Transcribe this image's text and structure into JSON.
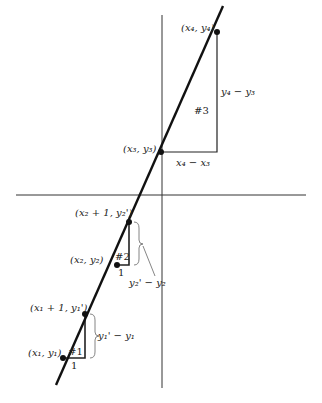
{
  "diagram": {
    "colors": {
      "line": "#111111",
      "axis": "#333333",
      "background": "#ffffff"
    },
    "axes": {
      "horizontal": {
        "x1": 16,
        "y1": 195,
        "x2": 306,
        "y2": 195
      },
      "vertical": {
        "x1": 162,
        "y1": 15,
        "x2": 162,
        "y2": 388
      }
    },
    "main_line": {
      "x1": 56,
      "y1": 385,
      "x2": 223,
      "y2": 6
    },
    "points": [
      {
        "id": "p4",
        "label": "(x4, y4)",
        "x": 217,
        "y": 32
      },
      {
        "id": "p3",
        "label": "(x3, y3)",
        "x": 161,
        "y": 152
      },
      {
        "id": "p2b",
        "label": "(x2 + 1, y2')",
        "x": 129,
        "y": 222
      },
      {
        "id": "p2",
        "label": "(x2, y2)",
        "x": 117,
        "y": 265
      },
      {
        "id": "p1b",
        "label": "(x1 + 1, y1')",
        "x": 85,
        "y": 314
      },
      {
        "id": "p1",
        "label": "(x1, y1)",
        "x": 63,
        "y": 358
      }
    ],
    "triangles": [
      {
        "id": "t3",
        "label": "#3",
        "run_label": "x4 − x3",
        "rise_label": "y4 − y3"
      },
      {
        "id": "t2",
        "label": "#2",
        "run_label": "1",
        "rise_label": "y2' − y2"
      },
      {
        "id": "t1",
        "label": "#1",
        "run_label": "1",
        "rise_label": "y1' − y1"
      }
    ],
    "labels": {
      "p4": "(x₄, y₄)",
      "p3": "(x₃, y₃)",
      "p2b": "(x₂ + 1, y₂')",
      "p2": "(x₂, y₂)",
      "p1b": "(x₁ + 1, y₁')",
      "p1": "(x₁, y₁)",
      "t3_num": "#3",
      "t3_run": "x₄ − x₃",
      "t3_rise": "y₄ − y₃",
      "t2_num": "#2",
      "t2_run": "1",
      "t2_rise": "y₂' − y₂",
      "t1_num": "#1",
      "t1_run": "1",
      "t1_rise": "y₁' − y₁"
    }
  }
}
